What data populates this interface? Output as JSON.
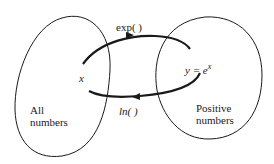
{
  "diagram": {
    "left_set": {
      "label_line1": "All",
      "label_line2": "numbers",
      "element": "x"
    },
    "right_set": {
      "label_line1": "Positive",
      "label_line2": "numbers",
      "element_prefix": "y = e",
      "element_sup": "x"
    },
    "arrows": {
      "top": {
        "label": "exp(  )",
        "direction": "left-to-right"
      },
      "bottom": {
        "label": "ln(  )",
        "direction": "right-to-left"
      }
    },
    "colors": {
      "stroke": "#1a1a1a",
      "background": "#ffffff"
    }
  }
}
